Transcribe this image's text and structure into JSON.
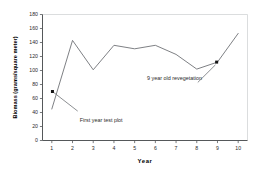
{
  "chart_data": {
    "type": "line",
    "title": "",
    "xlabel": "Year",
    "ylabel": "Biomass (grams/square meter)",
    "x": [
      1,
      2,
      3,
      4,
      5,
      6,
      7,
      8,
      9,
      10
    ],
    "xticklabels": [
      "1",
      "2",
      "3",
      "4",
      "5",
      "6",
      "7",
      "8",
      "9",
      "10"
    ],
    "yticklabels": [
      "0",
      "20",
      "40",
      "60",
      "80",
      "100",
      "120",
      "140",
      "160",
      "180"
    ],
    "yticks": [
      0,
      20,
      40,
      60,
      80,
      100,
      120,
      140,
      160,
      180
    ],
    "xlim": [
      0.55,
      10.45
    ],
    "ylim": [
      0,
      180
    ],
    "grid": false,
    "legend": null,
    "series": [
      {
        "name": "Biomass",
        "values": [
          45,
          143,
          101,
          136,
          131,
          136,
          123,
          102,
          112,
          153
        ]
      }
    ],
    "markers": [
      {
        "name": "first-year-test-plot-point",
        "x": 1.03,
        "y": 70
      },
      {
        "name": "nine-year-old-revegetation-point",
        "x": 8.96,
        "y": 112
      }
    ],
    "annotations": [
      {
        "id": "first-year-test-plot",
        "text": "First year test plot",
        "label_x": 2.35,
        "label_y": 30,
        "leader_from_x": 1.03,
        "leader_from_y": 70,
        "leader_to_x": 2.25,
        "leader_to_y": 42
      },
      {
        "id": "nine-year-old-revegetation",
        "text": "9 year old revegetation",
        "label_x": 5.6,
        "label_y": 90,
        "leader_from_x": 8.9,
        "leader_from_y": 108,
        "leader_to_x": 8.05,
        "leader_to_y": 83
      }
    ],
    "colors": {
      "line": "#6f7276",
      "axis": "#55585a",
      "frame": "#d2d4d6",
      "marker": "#151515",
      "background": "#ffffff",
      "text": "#2b2b2b"
    }
  }
}
